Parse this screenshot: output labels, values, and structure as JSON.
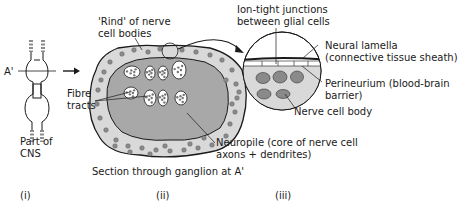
{
  "diagram": {
    "panel_i": {
      "section_marker": "A'",
      "caption_lines": [
        "Part of",
        "CNS"
      ],
      "numeral": "(i)"
    },
    "panel_ii": {
      "rind_label_lines": [
        "'Rind' of nerve",
        "cell bodies"
      ],
      "fibre_label_lines": [
        "Fibre",
        "tracts"
      ],
      "neuropile_label_lines": [
        "Neuropile (core of nerve cell",
        "axons + dendrites)"
      ],
      "caption": "Section through ganglion at A'",
      "numeral": "(ii)"
    },
    "panel_iii": {
      "junctions_label_lines": [
        "Ion-tight junctions",
        "between glial cells"
      ],
      "lamella_label_lines": [
        "Neural lamella",
        "(connective tissue sheath)"
      ],
      "perineurium_label_lines": [
        "Perineurium (blood-brain",
        "barrier)"
      ],
      "cell_body_label": "Nerve cell body",
      "numeral": "(iii)"
    },
    "colors": {
      "rind_fill": "#d9d9d9",
      "neuropile_fill": "#a8a8a8",
      "dot_fill": "#8a8a8a",
      "outline": "#1a1a1a"
    }
  }
}
